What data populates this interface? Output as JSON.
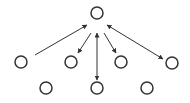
{
  "diagram": {
    "background": "#ffffff",
    "stroke_color": "#333333",
    "node_radius": 6,
    "nodes": [
      {
        "id": "root",
        "x": 97,
        "y": 13
      },
      {
        "id": "l1",
        "x": 21,
        "y": 62
      },
      {
        "id": "l2",
        "x": 71,
        "y": 62
      },
      {
        "id": "l3",
        "x": 121,
        "y": 62
      },
      {
        "id": "l4",
        "x": 172,
        "y": 63
      },
      {
        "id": "b1",
        "x": 46,
        "y": 88
      },
      {
        "id": "b2",
        "x": 97,
        "y": 88
      },
      {
        "id": "b3",
        "x": 147,
        "y": 88
      }
    ],
    "edges": [
      {
        "from": "l1",
        "to": "root",
        "direction": "forward",
        "x1": 35,
        "y1": 55,
        "x2": 87,
        "y2": 25
      },
      {
        "from": "root",
        "to": "l2",
        "direction": "forward",
        "x1": 91,
        "y1": 33,
        "x2": 78,
        "y2": 53
      },
      {
        "from": "root",
        "to": "b2",
        "direction": "both",
        "x1": 97,
        "y1": 33,
        "x2": 97,
        "y2": 80
      },
      {
        "from": "root",
        "to": "l3",
        "direction": "forward",
        "x1": 104,
        "y1": 33,
        "x2": 116,
        "y2": 53
      },
      {
        "from": "root",
        "to": "l4",
        "direction": "both",
        "x1": 107,
        "y1": 25,
        "x2": 163,
        "y2": 59
      }
    ]
  }
}
